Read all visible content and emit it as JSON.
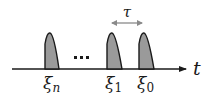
{
  "diagram": {
    "type": "pulse-timeline",
    "axis": {
      "label": "t"
    },
    "interval": {
      "label": "τ"
    },
    "ellipsis": "···",
    "pulses": [
      {
        "label_base": "ξ",
        "label_sub": "n"
      },
      {
        "label_base": "ξ",
        "label_sub": "1"
      },
      {
        "label_base": "ξ",
        "label_sub": "0"
      }
    ],
    "colors": {
      "pulse_fill": "#9a9a9a",
      "stroke": "#1a1a1a",
      "interval_arrow": "#8a8a8a"
    }
  }
}
